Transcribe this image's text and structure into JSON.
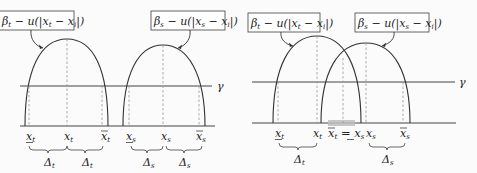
{
  "left_panel": {
    "label_t": {
      "main": "β",
      "sub": "t",
      "rest": " − u(|x",
      "sub2": "t",
      "rest2": " − x",
      "sub3": "i",
      "close": "|)"
    },
    "label_s": {
      "main": "β",
      "sub": "s",
      "rest": " − u(|x",
      "sub2": "s",
      "rest2": " − x",
      "sub3": "i",
      "close": "|)"
    },
    "threshold_label": "γ",
    "axis_labels": [
      {
        "id": "x_t_low",
        "base": "x",
        "sub": "t",
        "mark": "underline"
      },
      {
        "id": "x_t",
        "base": "x",
        "sub": "t",
        "mark": "none"
      },
      {
        "id": "x_t_high",
        "base": "x",
        "sub": "t",
        "mark": "overline"
      },
      {
        "id": "x_s_low",
        "base": "x",
        "sub": "s",
        "mark": "underline"
      },
      {
        "id": "x_s",
        "base": "x",
        "sub": "s",
        "mark": "none"
      },
      {
        "id": "x_s_high",
        "base": "x",
        "sub": "s",
        "mark": "overline"
      }
    ],
    "deltas": [
      {
        "base": "Δ",
        "sub": "t"
      },
      {
        "base": "Δ",
        "sub": "t"
      },
      {
        "base": "Δ",
        "sub": "s"
      },
      {
        "base": "Δ",
        "sub": "s"
      }
    ]
  },
  "right_panel": {
    "label_t": {
      "main": "β",
      "sub": "t",
      "rest": " − u(|x",
      "sub2": "t",
      "rest2": " − x",
      "sub3": "i",
      "close": "|)"
    },
    "label_s": {
      "main": "β",
      "sub": "s",
      "rest": " − u(|x",
      "sub2": "s",
      "rest2": " − x",
      "sub3": "i",
      "close": "|)"
    },
    "threshold_label": "γ",
    "axis_labels": [
      {
        "id": "x_t_low",
        "base": "x",
        "sub": "t",
        "mark": "underline"
      },
      {
        "id": "x_t",
        "base": "x",
        "sub": "t",
        "mark": "none"
      },
      {
        "id": "x_t_high_eq_x_s_low",
        "text_left": "x",
        "sub_left": "t",
        "eq": " = ",
        "text_right": "x",
        "sub_right": "s"
      },
      {
        "id": "x_s",
        "base": "x",
        "sub": "s",
        "mark": "none"
      },
      {
        "id": "x_s_high",
        "base": "x",
        "sub": "s",
        "mark": "overline"
      }
    ],
    "deltas": [
      {
        "base": "Δ",
        "sub": "t"
      },
      {
        "base": "Δ",
        "sub": "s"
      }
    ]
  }
}
